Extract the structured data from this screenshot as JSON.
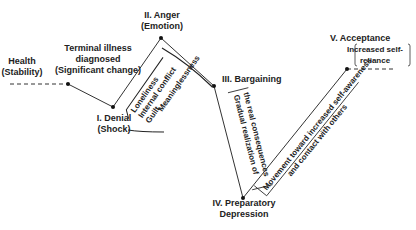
{
  "diagram": {
    "title": "",
    "start": {
      "line1": "Health",
      "line2": "(Stability)"
    },
    "trigger": {
      "line1": "Terminal illness",
      "line2": "diagnosed",
      "line3": "(Significant change)"
    },
    "stages": [
      {
        "id": "denial",
        "line1": "I.  Denial",
        "line2": "(Shock)"
      },
      {
        "id": "anger",
        "line1": "II.  Anger",
        "line2": "(Emotion)"
      },
      {
        "id": "bargaining",
        "line1": "III.  Bargaining"
      },
      {
        "id": "depression",
        "line1": "IV.  Preparatory",
        "line2": "Depression"
      },
      {
        "id": "acceptance",
        "line1": "V.  Acceptance"
      }
    ],
    "annotations": {
      "denial_anger": [
        "Loneliness",
        "Internal conflict",
        "Guilt",
        "Meaninglessness"
      ],
      "bargaining_depression": [
        "Gradual realization of",
        "the real consequences"
      ],
      "depression_acceptance": [
        "Movement toward increased self-awareness",
        "and contact with others"
      ],
      "acceptance": [
        "Increased self-",
        "reliance"
      ]
    },
    "colors": {
      "line": "#222222",
      "text": "#222222"
    }
  }
}
